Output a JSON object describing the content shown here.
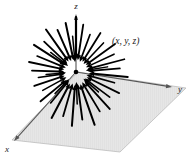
{
  "figure": {
    "type": "vector-field-diagram",
    "background_color": "#ffffff",
    "plane": {
      "fill_color": "#e6e6e6",
      "edge_color": "#b4b4b4",
      "points": "12,140 78,72 186,88 120,152"
    },
    "origin": {
      "x": 76,
      "y": 72,
      "dot_color": "#000000",
      "dot_radius": 2.3
    },
    "axes": [
      {
        "name": "z",
        "label": "z",
        "label_x": 76,
        "label_y": 9,
        "x1": 76,
        "y1": 72,
        "x2": 76,
        "y2": 14,
        "color": "#555555"
      },
      {
        "name": "y",
        "label": "y",
        "label_x": 180,
        "label_y": 92,
        "x1": 76,
        "y1": 72,
        "x2": 172,
        "y2": 87,
        "color": "#555555"
      },
      {
        "name": "x",
        "label": "x",
        "label_x": 7,
        "label_y": 152,
        "x1": 76,
        "y1": 72,
        "x2": 14,
        "y2": 141,
        "color": "#555555"
      }
    ],
    "point_label": {
      "text": "(x, y, z)",
      "x": 112,
      "y": 44
    },
    "vector_field": {
      "direction": "inward",
      "description": "arrows point radially inward toward the origin",
      "color": "#000000",
      "count": 40,
      "vectors": [
        {
          "angle": 90,
          "r_out": 55,
          "r_in": 13,
          "w": 2.2
        },
        {
          "angle": 101,
          "r_out": 50,
          "r_in": 12,
          "w": 2.0
        },
        {
          "angle": 112,
          "r_out": 46,
          "r_in": 12,
          "w": 1.9
        },
        {
          "angle": 123,
          "r_out": 52,
          "r_in": 13,
          "w": 2.0
        },
        {
          "angle": 134,
          "r_out": 44,
          "r_in": 12,
          "w": 1.8
        },
        {
          "angle": 145,
          "r_out": 50,
          "r_in": 13,
          "w": 2.0
        },
        {
          "angle": 156,
          "r_out": 42,
          "r_in": 11,
          "w": 1.7
        },
        {
          "angle": 167,
          "r_out": 48,
          "r_in": 12,
          "w": 1.9
        },
        {
          "angle": 178,
          "r_out": 44,
          "r_in": 12,
          "w": 1.9
        },
        {
          "angle": 189,
          "r_out": 38,
          "r_in": 11,
          "w": 1.6
        },
        {
          "angle": 200,
          "r_out": 44,
          "r_in": 12,
          "w": 1.8
        },
        {
          "angle": 211,
          "r_out": 38,
          "r_in": 11,
          "w": 1.6
        },
        {
          "angle": 222,
          "r_out": 46,
          "r_in": 13,
          "w": 1.9
        },
        {
          "angle": 233,
          "r_out": 40,
          "r_in": 11,
          "w": 1.7
        },
        {
          "angle": 244,
          "r_out": 52,
          "r_in": 13,
          "w": 2.0
        },
        {
          "angle": 255,
          "r_out": 46,
          "r_in": 12,
          "w": 1.8
        },
        {
          "angle": 266,
          "r_out": 54,
          "r_in": 13,
          "w": 2.0
        },
        {
          "angle": 277,
          "r_out": 48,
          "r_in": 12,
          "w": 1.9
        },
        {
          "angle": 288,
          "r_out": 56,
          "r_in": 13,
          "w": 2.0
        },
        {
          "angle": 299,
          "r_out": 46,
          "r_in": 12,
          "w": 1.8
        },
        {
          "angle": 310,
          "r_out": 50,
          "r_in": 13,
          "w": 1.9
        },
        {
          "angle": 321,
          "r_out": 42,
          "r_in": 11,
          "w": 1.7
        },
        {
          "angle": 332,
          "r_out": 48,
          "r_in": 12,
          "w": 1.8
        },
        {
          "angle": 343,
          "r_out": 40,
          "r_in": 11,
          "w": 1.6
        },
        {
          "angle": 354,
          "r_out": 52,
          "r_in": 13,
          "w": 1.9
        },
        {
          "angle": 5,
          "r_out": 44,
          "r_in": 12,
          "w": 1.7
        },
        {
          "angle": 16,
          "r_out": 50,
          "r_in": 12,
          "w": 1.8
        },
        {
          "angle": 27,
          "r_out": 42,
          "r_in": 11,
          "w": 1.6
        },
        {
          "angle": 38,
          "r_out": 48,
          "r_in": 12,
          "w": 1.8
        },
        {
          "angle": 49,
          "r_out": 40,
          "r_in": 11,
          "w": 1.6
        },
        {
          "angle": 60,
          "r_out": 46,
          "r_in": 12,
          "w": 1.8
        },
        {
          "angle": 71,
          "r_out": 40,
          "r_in": 11,
          "w": 1.7
        },
        {
          "angle": 82,
          "r_out": 48,
          "r_in": 12,
          "w": 1.8
        },
        {
          "angle": 95,
          "r_out": 36,
          "r_in": 10,
          "w": 1.5
        },
        {
          "angle": 140,
          "r_out": 32,
          "r_in": 10,
          "w": 1.5
        },
        {
          "angle": 185,
          "r_out": 30,
          "r_in": 10,
          "w": 1.5
        },
        {
          "angle": 228,
          "r_out": 30,
          "r_in": 10,
          "w": 1.5
        },
        {
          "angle": 272,
          "r_out": 32,
          "r_in": 10,
          "w": 1.5
        },
        {
          "angle": 316,
          "r_out": 30,
          "r_in": 10,
          "w": 1.5
        },
        {
          "angle": 10,
          "r_out": 32,
          "r_in": 10,
          "w": 1.5
        }
      ]
    }
  }
}
